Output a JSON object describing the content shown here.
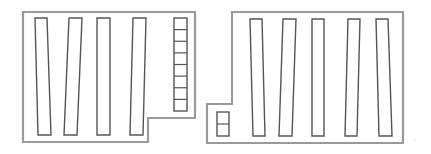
{
  "diagram": {
    "type": "floor-plan",
    "colors": {
      "wall": "#9a9a9a",
      "fixture": "#555555",
      "background": "#ffffff"
    },
    "rooms": [
      {
        "id": "left-room",
        "outline_points": "23,12 195,12 195,118 148,118 148,142 23,142",
        "shelves": [
          {
            "id": "left-shelf-1",
            "points": "35,18 47,18 51,135 38,135"
          },
          {
            "id": "left-shelf-2",
            "points": "69,18 82,18 77,135 64,135"
          },
          {
            "id": "left-shelf-3",
            "points": "97,18 110,18 110,135 97,135"
          },
          {
            "id": "left-shelf-4",
            "points": "133,18 146,18 143,135 130,135"
          }
        ],
        "bin_stacks": [
          {
            "id": "left-bin-stack",
            "x": 174,
            "y": 18,
            "width": 13,
            "height": 93,
            "cells": 8
          }
        ]
      },
      {
        "id": "right-room",
        "outline_points": "232,12 403,12 403,143 207,143 207,104 232,104",
        "shelves": [
          {
            "id": "right-shelf-1",
            "points": "250,19 262,19 265,136 253,136"
          },
          {
            "id": "right-shelf-2",
            "points": "283,19 296,19 292,136 279,136"
          },
          {
            "id": "right-shelf-3",
            "points": "312,19 324,19 324,136 312,136"
          },
          {
            "id": "right-shelf-4",
            "points": "348,19 360,19 357,136 345,136"
          },
          {
            "id": "right-shelf-5",
            "points": "376,19 388,19 392,136 379,136"
          }
        ],
        "bin_stacks": [
          {
            "id": "right-bin-stack",
            "x": 217,
            "y": 112,
            "width": 12,
            "height": 24,
            "cells": 2
          }
        ]
      }
    ]
  }
}
